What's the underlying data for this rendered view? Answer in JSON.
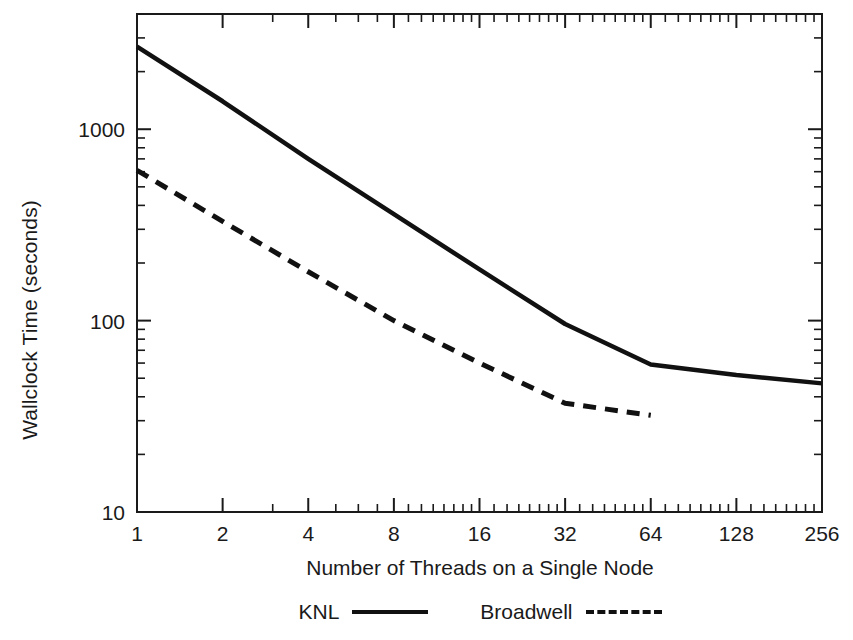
{
  "chart_data": {
    "type": "line",
    "title": "",
    "xlabel": "Number of Threads on a Single Node",
    "ylabel": "Wallclock Time (seconds)",
    "xscale": "log2",
    "yscale": "log10",
    "xlim": [
      1,
      256
    ],
    "ylim": [
      10,
      4000
    ],
    "grid": false,
    "xticks": [
      "1",
      "2",
      "4",
      "8",
      "16",
      "32",
      "64",
      "128",
      "256"
    ],
    "xtick_values": [
      1,
      2,
      4,
      8,
      16,
      32,
      64,
      128,
      256
    ],
    "yticks": [
      "10",
      "100",
      "1000"
    ],
    "ytick_values": [
      10,
      100,
      1000
    ],
    "legend_position": "below",
    "x": [
      1,
      2,
      4,
      8,
      16,
      32,
      64,
      128,
      256
    ],
    "series": [
      {
        "name": "KNL",
        "style": "solid",
        "color": "#111111",
        "x": [
          1,
          2,
          4,
          8,
          16,
          32,
          64,
          128,
          256
        ],
        "values": [
          2700,
          1400,
          700,
          360,
          185,
          96,
          59,
          52,
          47
        ]
      },
      {
        "name": "Broadwell",
        "style": "dashed",
        "color": "#111111",
        "x": [
          1,
          2,
          4,
          8,
          16,
          32,
          64
        ],
        "values": [
          610,
          330,
          180,
          100,
          60,
          37,
          32
        ]
      }
    ]
  },
  "legend": {
    "entries": [
      {
        "label": "KNL",
        "style": "solid"
      },
      {
        "label": "Broadwell",
        "style": "dashed"
      }
    ]
  },
  "axes": {
    "x_title": "Number of Threads on a Single Node",
    "y_title": "Wallclock Time (seconds)"
  }
}
